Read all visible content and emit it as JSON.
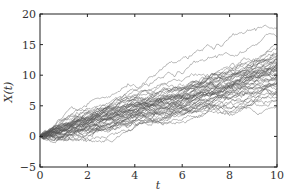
{
  "chart_data": {
    "type": "line",
    "title": "",
    "xlabel": "t",
    "ylabel": "X(t)",
    "xlim": [
      0,
      10
    ],
    "ylim": [
      -5,
      20
    ],
    "xticks": [
      "0",
      "2",
      "4",
      "6",
      "8",
      "10"
    ],
    "yticks": [
      "−5",
      "0",
      "5",
      "10",
      "15",
      "20"
    ],
    "grid": false,
    "legend": null,
    "series_summary": {
      "n_paths": 50,
      "start_value": 0,
      "mean_at_t10": 10,
      "max_at_t10": 16.5,
      "min_at_t10": 4,
      "line_color": "#555555"
    }
  }
}
